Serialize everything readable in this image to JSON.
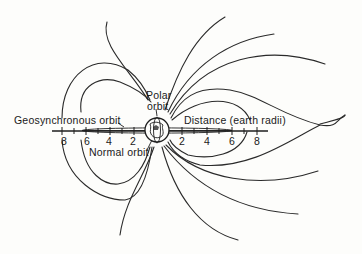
{
  "diagram": {
    "labels": {
      "geosynchronous": "Geosynchronous orbit",
      "polar_line1": "Polar",
      "polar_line2": "orbit",
      "distance": "Distance (earth radii)",
      "normal": "Normal orbit"
    },
    "axis": {
      "left_ticks": [
        "8",
        "6",
        "4",
        "2"
      ],
      "right_ticks": [
        "2",
        "4",
        "6",
        "8"
      ],
      "unit": "earth radii"
    },
    "colors": {
      "line": "#2a2a2a",
      "background": "#fdfdfb"
    }
  }
}
